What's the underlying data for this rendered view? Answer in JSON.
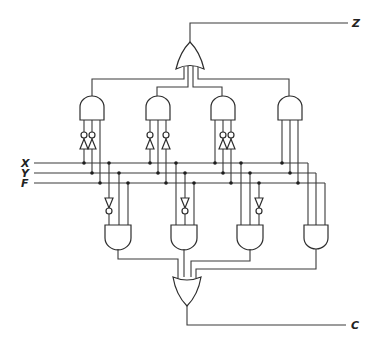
{
  "diagram": {
    "type": "logic-circuit",
    "style": "hand-drawn schematic",
    "inputs": [
      {
        "label": "X",
        "y": 163
      },
      {
        "label": "Y",
        "y": 173
      },
      {
        "label": "F",
        "y": 183
      }
    ],
    "outputs": [
      {
        "label": "Z",
        "source": "upper-or-gate"
      },
      {
        "label": "C",
        "source": "lower-or-gate"
      }
    ],
    "upper_and_gates": [
      {
        "id": "A1",
        "inputs": [
          "X'",
          "Y'",
          "F"
        ]
      },
      {
        "id": "A2",
        "inputs": [
          "X",
          "Y'",
          "F'"
        ]
      },
      {
        "id": "A3",
        "inputs": [
          "X'",
          "Y",
          "F'"
        ]
      },
      {
        "id": "A4",
        "inputs": [
          "X",
          "Y",
          "F"
        ]
      }
    ],
    "lower_and_gates": [
      {
        "id": "B1",
        "inputs": [
          "X'",
          "Y",
          "F"
        ]
      },
      {
        "id": "B2",
        "inputs": [
          "X'",
          "Y",
          "F"
        ]
      },
      {
        "id": "B3",
        "inputs": [
          "X",
          "Y'",
          "F"
        ]
      },
      {
        "id": "B4",
        "inputs": [
          "X",
          "Y",
          "F"
        ]
      }
    ],
    "or_gates": [
      {
        "id": "OR_Z",
        "inputs": [
          "A1",
          "A2",
          "A3",
          "A4"
        ],
        "output": "Z"
      },
      {
        "id": "OR_C",
        "inputs": [
          "B1",
          "B2",
          "B3",
          "B4"
        ],
        "output": "C"
      }
    ],
    "colors": {
      "line": "#3a3a3a",
      "background": "#ffffff"
    }
  }
}
